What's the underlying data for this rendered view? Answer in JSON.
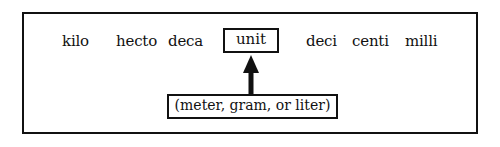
{
  "diagram": {
    "prefixes_left": [
      "kilo",
      "hecto",
      "deca"
    ],
    "center": "unit",
    "prefixes_right": [
      "deci",
      "centi",
      "milli"
    ],
    "base_units_label": "(meter, gram, or liter)"
  }
}
